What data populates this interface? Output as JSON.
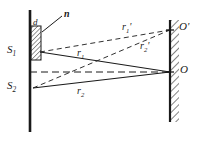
{
  "figure": {
    "background_color": "#ffffff",
    "ink_color": "#1a1a1a",
    "labels": {
      "slab_index": "n",
      "slab_thickness": "d",
      "source_top": "S",
      "source_top_sub": "1",
      "source_bottom": "S",
      "source_bottom_sub": "2",
      "ray_one": "r",
      "ray_one_sub": "1",
      "ray_two": "r",
      "ray_two_sub": "2",
      "ray_one_prime": "r",
      "ray_one_prime_sub": "1",
      "ray_one_prime_mark": "'",
      "ray_two_prime": "r",
      "ray_two_prime_sub": "2",
      "ray_two_prime_mark": "'",
      "point_o": "O",
      "point_o_prime": "O",
      "point_o_prime_mark": "'"
    },
    "geometry": {
      "barrier": {
        "x": 30,
        "y_top": 10,
        "y_bottom": 132
      },
      "screen": {
        "x": 170,
        "y_top": 20,
        "y_bottom": 122
      },
      "slab": {
        "x": 30,
        "y_top": 26,
        "width": 10,
        "height": 34
      },
      "source_top_point": {
        "x": 40,
        "y": 52
      },
      "source_bottom_point": {
        "x": 33,
        "y": 88
      },
      "point_o": {
        "x": 170,
        "y": 72
      },
      "point_o_prime": {
        "x": 170,
        "y": 30
      },
      "axis_y": 72,
      "leader_from": {
        "x": 62,
        "y": 16
      },
      "leader_to": {
        "x": 42,
        "y": 32
      }
    },
    "elements": [
      "left-barrier",
      "thin-film-slab",
      "right-screen",
      "optical-axis",
      "solid-ray-r1",
      "solid-ray-r2",
      "dashed-ray-r1-prime",
      "dashed-ray-r2-prime",
      "leader-line-n"
    ]
  }
}
